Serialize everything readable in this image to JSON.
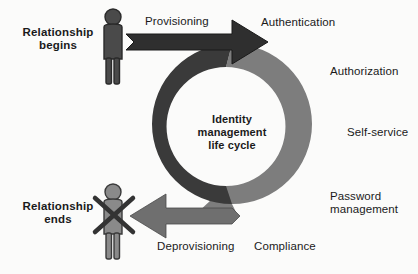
{
  "diagram": {
    "center_title": "Identity\nmanagement\nlife cycle",
    "endpoints": [
      {
        "id": "begins",
        "label": "Relationship\nbegins",
        "figure": "person-icon"
      },
      {
        "id": "ends",
        "label": "Relationship\nends",
        "figure": "person-crossed-out-icon"
      }
    ],
    "transitions": [
      {
        "id": "provisioning",
        "label": "Provisioning",
        "direction": "right",
        "color": "#2f2f2f"
      },
      {
        "id": "deprovisioning",
        "label": "Deprovisioning",
        "direction": "left",
        "color": "#7d7d7d"
      }
    ],
    "stages": [
      {
        "id": "authentication",
        "label": "Authentication"
      },
      {
        "id": "authorization",
        "label": "Authorization"
      },
      {
        "id": "self-service",
        "label": "Self-service"
      },
      {
        "id": "password-management",
        "label": "Password\nmanagement"
      },
      {
        "id": "compliance",
        "label": "Compliance"
      }
    ],
    "colors": {
      "ring_dark": "#3a3a3a",
      "ring_light": "#7d7d7d",
      "arrow_dark": "#2f2f2f",
      "arrow_light": "#6f6f6f",
      "figure_dark": "#3f3f3f",
      "figure_light": "#8a8a8a",
      "text": "#1a1a1a",
      "background": "#fbfbfa"
    }
  }
}
